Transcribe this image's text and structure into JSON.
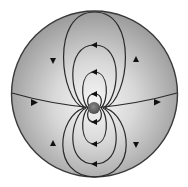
{
  "diagram": {
    "type": "field-line diagram",
    "disk": {
      "cx": 94.5,
      "cy": 94,
      "r": 83,
      "fill_center": "#f4f4f4",
      "fill_edge": "#9c9c9c",
      "stroke": "#3a3a3a"
    },
    "source": {
      "cx": 94,
      "cy": 108,
      "r": 6,
      "fill": "#6a6a6a"
    },
    "line_color": "#2a2a2a",
    "arrow_color": "#111111",
    "upper_loops": [
      {
        "name": "upper-loop-1",
        "top_y": 94,
        "half_width": 6,
        "arrow": "left"
      },
      {
        "name": "upper-loop-2",
        "top_y": 72,
        "half_width": 13,
        "arrow": "left"
      },
      {
        "name": "upper-loop-3",
        "top_y": 45,
        "half_width": 28,
        "arrow": "left"
      },
      {
        "name": "upper-loop-4",
        "top_y": 12,
        "half_width": 42,
        "arrow_left": "down",
        "arrow_right": "up"
      }
    ],
    "lower_loops": [
      {
        "name": "lower-loop-1",
        "bottom_y": 122,
        "half_width": 6,
        "arrow": "left"
      },
      {
        "name": "lower-loop-2",
        "bottom_y": 144,
        "half_width": 13,
        "arrow": "left"
      },
      {
        "name": "lower-loop-3",
        "bottom_y": 164,
        "half_width": 28,
        "arrow": "left"
      },
      {
        "name": "lower-loop-4",
        "bottom_y": 178,
        "half_width": 42,
        "arrow_left": "up",
        "arrow_right": "down"
      }
    ],
    "horizontal_line": {
      "arrows": [
        "right",
        "right"
      ]
    }
  }
}
